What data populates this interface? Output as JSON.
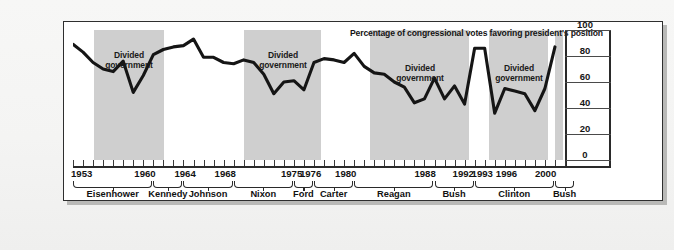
{
  "figure": {
    "title": "Percentage of congressional votes favoring president's position",
    "band_label_line1": "Divided",
    "band_label_line2": "government",
    "colors": {
      "band_shade": "#cfcfcf",
      "line": "#151515",
      "frame": "#2e2e2e",
      "paper": "#f5f5f4"
    }
  },
  "chart_data": {
    "type": "line",
    "title": "Percentage of congressional votes favoring president's position",
    "xlabel": "",
    "ylabel": "",
    "ylim": [
      0,
      100
    ],
    "yticks": [
      0,
      20,
      40,
      60,
      80,
      100
    ],
    "xlim": [
      1953,
      2002
    ],
    "grid": false,
    "legend": false,
    "x": [
      1953,
      1954,
      1955,
      1956,
      1957,
      1958,
      1959,
      1960,
      1961,
      1962,
      1963,
      1964,
      1965,
      1966,
      1967,
      1968,
      1969,
      1970,
      1971,
      1972,
      1973,
      1974,
      1975,
      1976,
      1977,
      1978,
      1979,
      1980,
      1981,
      1982,
      1983,
      1984,
      1985,
      1986,
      1987,
      1988,
      1989,
      1990,
      1991,
      1992,
      1993,
      1994,
      1995,
      1996,
      1997,
      1998,
      1999,
      2000,
      2001
    ],
    "y": [
      89,
      83,
      75,
      70,
      68,
      76,
      52,
      65,
      81,
      85,
      87,
      88,
      93,
      79,
      79,
      75,
      74,
      77,
      75,
      66,
      51,
      60,
      61,
      54,
      75,
      78,
      77,
      75,
      82,
      72,
      67,
      66,
      60,
      56,
      44,
      47,
      63,
      47,
      57,
      43,
      86,
      86,
      36,
      55,
      53,
      51,
      38,
      55,
      87
    ],
    "series": [
      {
        "name": "Percentage of congressional votes favoring president's position",
        "values": [
          89,
          83,
          75,
          70,
          68,
          76,
          52,
          65,
          81,
          85,
          87,
          88,
          93,
          79,
          79,
          75,
          74,
          77,
          75,
          66,
          51,
          60,
          61,
          54,
          75,
          78,
          77,
          75,
          82,
          72,
          67,
          66,
          60,
          56,
          44,
          47,
          63,
          47,
          57,
          43,
          86,
          86,
          36,
          55,
          53,
          51,
          38,
          55,
          87
        ]
      }
    ],
    "xtick_labels": [
      "1953",
      "1960",
      "1964",
      "1968",
      "1975",
      "1976",
      "1980",
      "1988",
      "1992",
      "1993",
      "1996",
      "2000"
    ],
    "shaded_regions": [
      {
        "label": "Divided government",
        "start": 1955,
        "end": 1961
      },
      {
        "label": "Divided government",
        "start": 1969,
        "end": 1977
      },
      {
        "label": "Divided government",
        "start": 1981,
        "end": 1993
      },
      {
        "label": "Divided government",
        "start": 1995,
        "end": 2001
      }
    ],
    "presidents": [
      {
        "name": "Eisenhower",
        "start": 1953,
        "end": 1960
      },
      {
        "name": "Kennedy",
        "start": 1961,
        "end": 1963
      },
      {
        "name": "Johnson",
        "start": 1964,
        "end": 1968
      },
      {
        "name": "Nixon",
        "start": 1969,
        "end": 1974
      },
      {
        "name": "Ford",
        "start": 1975,
        "end": 1976
      },
      {
        "name": "Carter",
        "start": 1977,
        "end": 1980
      },
      {
        "name": "Reagan",
        "start": 1981,
        "end": 1988
      },
      {
        "name": "Bush",
        "start": 1989,
        "end": 1992
      },
      {
        "name": "Clinton",
        "start": 1993,
        "end": 2000
      },
      {
        "name": "Bush",
        "start": 2001,
        "end": 2002
      }
    ]
  },
  "axis": {
    "y_tick_labels": [
      "100",
      "80",
      "60",
      "40",
      "20",
      "0"
    ],
    "x_year_labels": [
      "1953",
      "1960",
      "1964",
      "1968",
      "1975",
      "1976",
      "1980",
      "1988",
      "1992",
      "1993",
      "1996",
      "2000"
    ],
    "president_labels": [
      "Eisenhower",
      "Kennedy",
      "Johnson",
      "Nixon",
      "Ford",
      "Carter",
      "Reagan",
      "Bush",
      "Clinton",
      "Bush"
    ]
  }
}
